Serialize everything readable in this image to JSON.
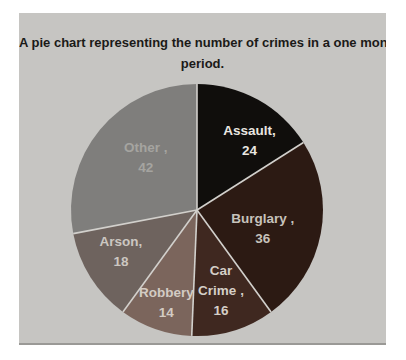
{
  "page": {
    "background_color": "#ffffff",
    "panel_color": "#c6c5c2"
  },
  "chart_data": {
    "type": "pie",
    "title": "A pie chart representing the number of crimes in a one month period.",
    "title_lines": [
      "A pie chart representing the number of crimes in a one month",
      "period."
    ],
    "categories": [
      "Assault",
      "Burglary",
      "Car Crime",
      "Robbery",
      "Arson",
      "Other"
    ],
    "values": [
      24,
      36,
      16,
      14,
      18,
      42
    ],
    "total": 150,
    "start_angle_deg": 0,
    "direction": "clockwise",
    "legend": "none",
    "separator_color": "#d2d0cc",
    "slices": [
      {
        "label": "Assault",
        "value": 24,
        "color": "#100e0c",
        "text_color": "#e9e6e1",
        "text_lines": [
          "Assault,",
          "24"
        ]
      },
      {
        "label": "Burglary",
        "value": 36,
        "color": "#2c1a13",
        "text_color": "#c7c2bb",
        "text_lines": [
          "Burglary ,",
          "36"
        ]
      },
      {
        "label": "Car Crime",
        "value": 16,
        "color": "#3f2820",
        "text_color": "#d5cfc7",
        "text_lines": [
          "Car",
          "Crime ,",
          "16"
        ]
      },
      {
        "label": "Robbery",
        "value": 14,
        "color": "#7b655c",
        "text_color": "#d3cbc3",
        "text_lines": [
          "Robbery",
          "14"
        ]
      },
      {
        "label": "Arson",
        "value": 18,
        "color": "#6e635e",
        "text_color": "#ccc7c1",
        "text_lines": [
          "Arson,",
          "18"
        ]
      },
      {
        "label": "Other",
        "value": 42,
        "color": "#7f7e7c",
        "text_color": "#a5a4a0",
        "text_lines": [
          "Other ,",
          "42"
        ]
      }
    ]
  }
}
